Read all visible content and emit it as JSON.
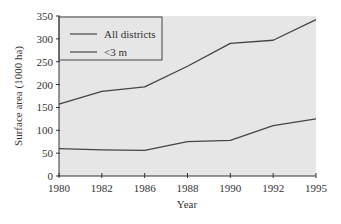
{
  "chart_data": {
    "type": "line",
    "title": "",
    "xlabel": "Year",
    "ylabel": "Surface area (1000 ha)",
    "categories": [
      "1980",
      "1982",
      "1986",
      "1988",
      "1990",
      "1992",
      "1995"
    ],
    "series": [
      {
        "name": "All districts",
        "values": [
          157,
          185,
          195,
          240,
          290,
          297,
          342
        ]
      },
      {
        "name": "<3 m",
        "values": [
          60,
          57,
          56,
          75,
          78,
          110,
          125
        ]
      }
    ],
    "yticks": [
      0,
      50,
      100,
      150,
      200,
      250,
      300,
      350
    ],
    "ylim": [
      0,
      350
    ],
    "grid": false,
    "legend_position": "upper-left",
    "colors": {
      "plot_bg": "#e6e6e6",
      "line": "#444444",
      "axis": "#333333"
    }
  },
  "legend": {
    "items": [
      "All districts",
      "<3 m"
    ]
  },
  "axes": {
    "xlabel": "Year",
    "ylabel": "Surface area (1000 ha)"
  }
}
